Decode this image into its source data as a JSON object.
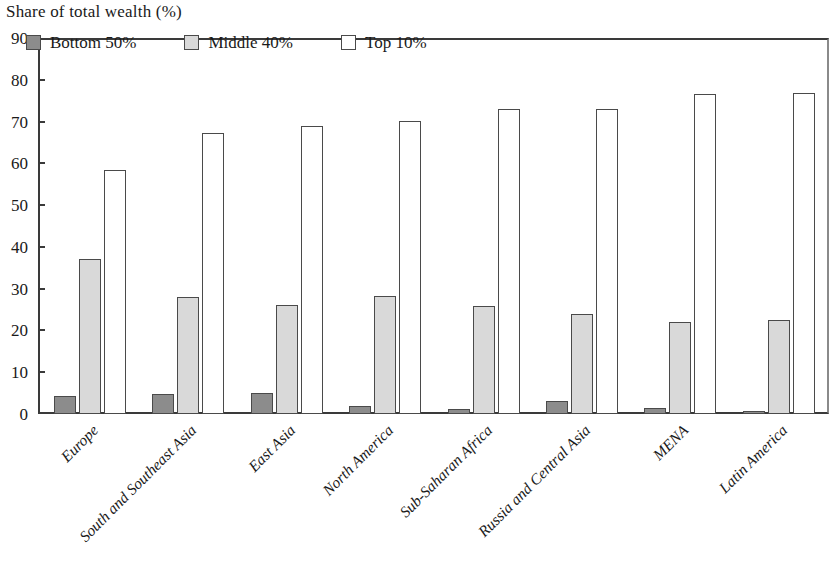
{
  "chart_data": {
    "type": "bar",
    "title": "Share  of total wealth (%)",
    "xlabel": "",
    "ylabel": "",
    "ylim": [
      0,
      90
    ],
    "y_ticks": [
      0,
      10,
      20,
      30,
      40,
      50,
      60,
      70,
      80,
      90
    ],
    "grid": false,
    "legend_position": "top-left inside plot",
    "categories": [
      "Europe",
      "South and Southeast Asia",
      "East Asia",
      "North America",
      "Sub-Saharan Africa",
      "Russia and Central Asia",
      "MENA",
      "Latin America"
    ],
    "series": [
      {
        "name": "Bottom 50%",
        "color": "#8c8c8c",
        "values": [
          4.4,
          4.8,
          5.0,
          1.8,
          1.3,
          3.0,
          1.4,
          0.7
        ]
      },
      {
        "name": "Middle 40%",
        "color": "#d9d9d9",
        "values": [
          37.0,
          28.0,
          26.0,
          28.2,
          25.8,
          23.9,
          22.1,
          22.4
        ]
      },
      {
        "name": "Top 10%",
        "color": "#ffffff",
        "values": [
          58.5,
          67.2,
          69.0,
          70.2,
          73.0,
          73.0,
          76.5,
          76.9
        ]
      }
    ]
  },
  "axis": {
    "line_color": "#3a3a3a",
    "bar_outline_color": "#4a4a4a"
  }
}
